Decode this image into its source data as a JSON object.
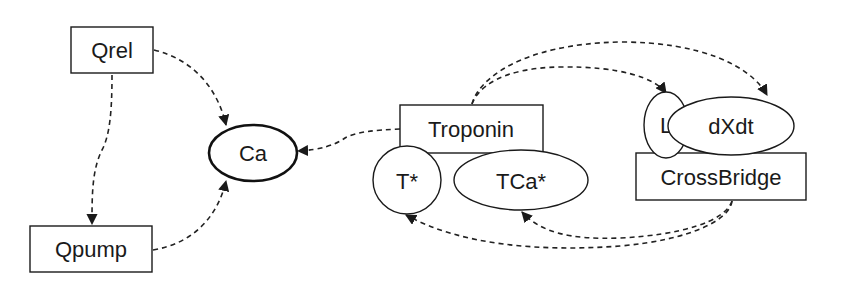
{
  "diagram": {
    "nodes": {
      "qrel": {
        "label": "Qrel",
        "shape": "rectangle"
      },
      "qpump": {
        "label": "Qpump",
        "shape": "rectangle"
      },
      "ca": {
        "label": "Ca",
        "shape": "ellipse-bold"
      },
      "troponin": {
        "label": "Troponin",
        "shape": "rectangle"
      },
      "t_star": {
        "label": "T*",
        "shape": "circle"
      },
      "tca_star": {
        "label": "TCa*",
        "shape": "ellipse"
      },
      "l": {
        "label": "L",
        "shape": "ellipse"
      },
      "dxdt": {
        "label": "dXdt",
        "shape": "ellipse"
      },
      "crossbridge": {
        "label": "CrossBridge",
        "shape": "rectangle"
      }
    },
    "edges": [
      {
        "from": "Qrel",
        "to": "Ca",
        "style": "dashed-arrow"
      },
      {
        "from": "Qrel",
        "to": "Qpump",
        "style": "dashed-arrow"
      },
      {
        "from": "Qpump",
        "to": "Ca",
        "style": "dashed-arrow"
      },
      {
        "from": "Troponin",
        "to": "Ca",
        "style": "dashed-arrow"
      },
      {
        "from": "Troponin",
        "to": "L",
        "style": "dashed-arrow"
      },
      {
        "from": "Troponin",
        "to": "dXdt",
        "style": "dashed-arrow"
      },
      {
        "from": "CrossBridge",
        "to": "T*",
        "style": "dashed-arrow"
      },
      {
        "from": "CrossBridge",
        "to": "TCa*",
        "style": "dashed-arrow"
      }
    ],
    "colors": {
      "stroke": "#1a1a1a",
      "background": "#ffffff"
    }
  }
}
